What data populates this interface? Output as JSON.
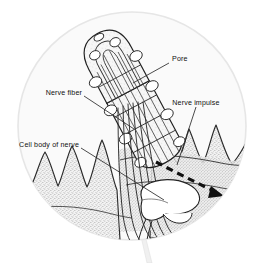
{
  "figure": {
    "kind": "anatomical-diagram",
    "frame_shape": "circle-with-handle",
    "background_color": "#ffffff",
    "circle_fill_color": "#fafafa",
    "circle_edge_color": "#e3e3e3",
    "tissue_stipple_color": "#a8a8a8",
    "ink_color": "#1a1a1a",
    "impulse_arrow_color": "#111111",
    "cell_body_fill": "#ffffff"
  },
  "labels": {
    "pore": "Pore",
    "nerve_fiber": "Nerve fiber",
    "nerve_impulse": "Nerve impulse",
    "cell_body_of_nerve": "Cell body of nerve"
  },
  "annotations": {
    "arrow_name": "nerve-impulse-arrow",
    "arrow_style": "dashed-with-arrowhead",
    "arrow_direction": "left-to-right-downward"
  }
}
